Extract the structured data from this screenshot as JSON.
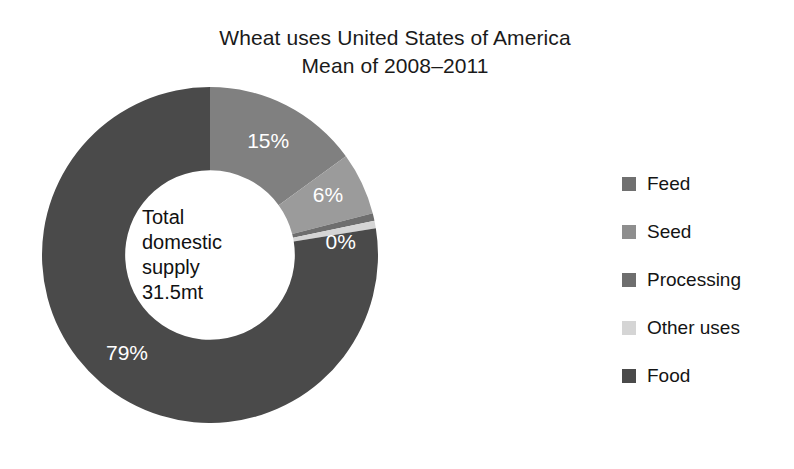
{
  "title": {
    "line1": "Wheat uses United States of America",
    "line2": "Mean of 2008–2011"
  },
  "center": {
    "line1": "Total",
    "line2": "domestic",
    "line3": "supply",
    "line4": "31.5mt"
  },
  "legend": {
    "items": [
      {
        "label": "Feed",
        "color": "#707070"
      },
      {
        "label": "Seed",
        "color": "#8e8e8e"
      },
      {
        "label": "Processing",
        "color": "#6e6e6e"
      },
      {
        "label": "Other uses",
        "color": "#d5d5d5"
      },
      {
        "label": "Food",
        "color": "#4a4a4a"
      }
    ]
  },
  "chart_data": {
    "type": "pie",
    "variant": "donut",
    "title": "Wheat uses United States of America\nMean of 2008–2011",
    "center_label": "Total domestic supply 31.5mt",
    "total_value": 31.5,
    "total_units": "mt",
    "start_angle_deg": 0,
    "direction": "clockwise",
    "inner_radius_ratio": 0.505,
    "legend_position": "right",
    "categories": [
      "Feed",
      "Seed",
      "Processing",
      "Other uses",
      "Food"
    ],
    "values": [
      15,
      6,
      0,
      0,
      79
    ],
    "data_labels": [
      "15%",
      "6%",
      "0%",
      "",
      "79%"
    ],
    "colors": [
      "#808080",
      "#9b9b9b",
      "#6e6e6e",
      "#d5d5d5",
      "#4a4a4a"
    ],
    "slice_label_color": "#ffffff"
  }
}
